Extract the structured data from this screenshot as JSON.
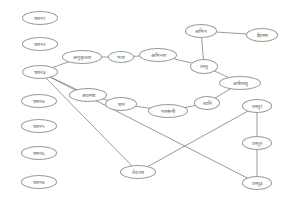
{
  "diagram": {
    "type": "concept-graph",
    "colors": {
      "edge": "#8e8e8e",
      "node_border": "#9a9a9a",
      "text": "#555555",
      "background": "#ffffff"
    },
    "nodes": [
      {
        "id": "L1",
        "label": "चयन१",
        "x": 40,
        "y": 18,
        "w": 36,
        "h": 14
      },
      {
        "id": "L2",
        "label": "चयन२",
        "x": 40,
        "y": 44,
        "w": 36,
        "h": 14
      },
      {
        "id": "L3",
        "label": "चयन३",
        "x": 40,
        "y": 72,
        "w": 36,
        "h": 14
      },
      {
        "id": "L4",
        "label": "चयन४",
        "x": 39,
        "y": 101,
        "w": 36,
        "h": 14
      },
      {
        "id": "L5",
        "label": "चयन५",
        "x": 39,
        "y": 126,
        "w": 36,
        "h": 14
      },
      {
        "id": "L6",
        "label": "चयन६",
        "x": 39,
        "y": 153,
        "w": 36,
        "h": 14
      },
      {
        "id": "L7",
        "label": "चयन७",
        "x": 39,
        "y": 182,
        "w": 36,
        "h": 14
      },
      {
        "id": "N1",
        "label": "अनुकृतता",
        "x": 82,
        "y": 57,
        "w": 40,
        "h": 14
      },
      {
        "id": "N2",
        "label": "भाव",
        "x": 121,
        "y": 57,
        "w": 26,
        "h": 12
      },
      {
        "id": "N3",
        "label": "अभिनय",
        "x": 158,
        "y": 55,
        "w": 38,
        "h": 14
      },
      {
        "id": "N4",
        "label": "अभिन",
        "x": 201,
        "y": 31,
        "w": 32,
        "h": 14
      },
      {
        "id": "N5",
        "label": "ईहसम",
        "x": 262,
        "y": 35,
        "w": 32,
        "h": 14
      },
      {
        "id": "N6",
        "label": "वस्तु",
        "x": 204,
        "y": 66,
        "w": 28,
        "h": 15
      },
      {
        "id": "N7",
        "label": "अर्थवस्तु",
        "x": 240,
        "y": 83,
        "w": 42,
        "h": 14
      },
      {
        "id": "N8",
        "label": "अवस्था",
        "x": 88,
        "y": 95,
        "w": 38,
        "h": 14
      },
      {
        "id": "N9",
        "label": "प्रान",
        "x": 121,
        "y": 104,
        "w": 32,
        "h": 14
      },
      {
        "id": "N10",
        "label": "पराश्रमी",
        "x": 168,
        "y": 111,
        "w": 40,
        "h": 14
      },
      {
        "id": "N11",
        "label": "ध्वनि",
        "x": 207,
        "y": 103,
        "w": 26,
        "h": 14
      },
      {
        "id": "N12",
        "label": "वस्तु१",
        "x": 257,
        "y": 106,
        "w": 30,
        "h": 14
      },
      {
        "id": "N13",
        "label": "वस्तु२",
        "x": 257,
        "y": 143,
        "w": 30,
        "h": 14
      },
      {
        "id": "N14",
        "label": "वस्तु३",
        "x": 257,
        "y": 183,
        "w": 30,
        "h": 14
      },
      {
        "id": "N15",
        "label": "वेदनार",
        "x": 138,
        "y": 172,
        "w": 36,
        "h": 14
      }
    ],
    "edges": [
      [
        "L3",
        "N1"
      ],
      [
        "N1",
        "N2"
      ],
      [
        "N2",
        "N3"
      ],
      [
        "N3",
        "N6"
      ],
      [
        "N4",
        "N6"
      ],
      [
        "N4",
        "N5"
      ],
      [
        "N6",
        "N7"
      ],
      [
        "N7",
        "N11"
      ],
      [
        "L3",
        "N8"
      ],
      [
        "N8",
        "N9"
      ],
      [
        "N9",
        "N10"
      ],
      [
        "N10",
        "N11"
      ],
      [
        "L3",
        "N15"
      ],
      [
        "L3",
        "N14"
      ],
      [
        "N15",
        "N12"
      ],
      [
        "N12",
        "N13"
      ],
      [
        "N13",
        "N14"
      ]
    ]
  }
}
